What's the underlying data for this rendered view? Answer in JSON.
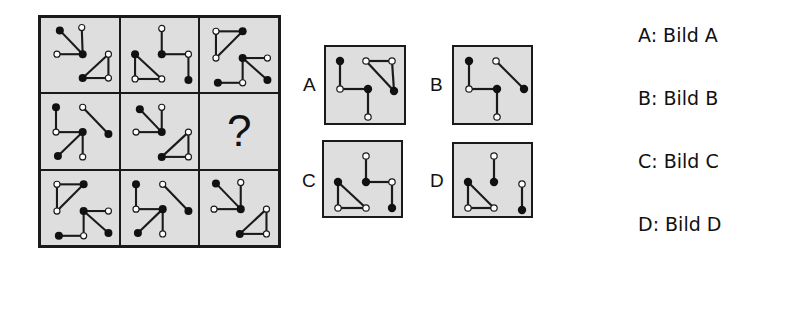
{
  "puzzle": {
    "question_mark": "?",
    "cells": [
      {
        "lines": [
          [
            19,
            13,
            43,
            38
          ],
          [
            42,
            10,
            43,
            38
          ],
          [
            16,
            38,
            43,
            38
          ],
          [
            43,
            63,
            70,
            38
          ],
          [
            70,
            38,
            70,
            63
          ],
          [
            70,
            63,
            43,
            63
          ]
        ],
        "filled": [
          [
            19,
            13
          ],
          [
            43,
            38
          ],
          [
            43,
            63
          ]
        ],
        "open": [
          [
            42,
            10
          ],
          [
            16,
            38
          ],
          [
            70,
            38
          ],
          [
            70,
            63
          ]
        ]
      },
      {
        "lines": [
          [
            42,
            11,
            42,
            38
          ],
          [
            42,
            38,
            70,
            38
          ],
          [
            70,
            38,
            70,
            65
          ],
          [
            14,
            38,
            42,
            64
          ],
          [
            14,
            38,
            14,
            64
          ],
          [
            14,
            64,
            42,
            64
          ]
        ],
        "filled": [
          [
            42,
            38
          ],
          [
            70,
            65
          ],
          [
            14,
            38
          ]
        ],
        "open": [
          [
            42,
            11
          ],
          [
            70,
            38
          ],
          [
            14,
            64
          ],
          [
            42,
            64
          ]
        ]
      },
      {
        "lines": [
          [
            16,
            14,
            44,
            14
          ],
          [
            16,
            14,
            16,
            42
          ],
          [
            16,
            42,
            44,
            14
          ],
          [
            44,
            42,
            70,
            42
          ],
          [
            44,
            42,
            70,
            65
          ],
          [
            44,
            42,
            44,
            68
          ],
          [
            18,
            68,
            44,
            68
          ]
        ],
        "filled": [
          [
            44,
            14
          ],
          [
            44,
            42
          ],
          [
            70,
            65
          ],
          [
            18,
            68
          ]
        ],
        "open": [
          [
            16,
            14
          ],
          [
            16,
            42
          ],
          [
            70,
            42
          ],
          [
            44,
            68
          ]
        ]
      },
      {
        "lines": [
          [
            15,
            14,
            15,
            40
          ],
          [
            15,
            40,
            43,
            40
          ],
          [
            43,
            40,
            17,
            65
          ],
          [
            43,
            40,
            43,
            66
          ],
          [
            43,
            14,
            70,
            42
          ]
        ],
        "filled": [
          [
            15,
            14
          ],
          [
            43,
            40
          ],
          [
            17,
            65
          ],
          [
            70,
            42
          ]
        ],
        "open": [
          [
            15,
            40
          ],
          [
            43,
            66
          ],
          [
            43,
            14
          ]
        ]
      },
      {
        "lines": [
          [
            19,
            16,
            42,
            40
          ],
          [
            42,
            14,
            42,
            40
          ],
          [
            15,
            40,
            42,
            40
          ],
          [
            42,
            66,
            70,
            40
          ],
          [
            70,
            40,
            70,
            66
          ],
          [
            70,
            66,
            42,
            66
          ]
        ],
        "filled": [
          [
            19,
            16
          ],
          [
            42,
            40
          ],
          [
            42,
            66
          ]
        ],
        "open": [
          [
            42,
            14
          ],
          [
            15,
            40
          ],
          [
            70,
            40
          ],
          [
            70,
            66
          ]
        ]
      },
      null,
      {
        "lines": [
          [
            16,
            14,
            44,
            14
          ],
          [
            16,
            14,
            16,
            42
          ],
          [
            16,
            42,
            44,
            14
          ],
          [
            44,
            42,
            70,
            42
          ],
          [
            44,
            42,
            70,
            65
          ],
          [
            44,
            42,
            44,
            68
          ],
          [
            18,
            68,
            44,
            68
          ]
        ],
        "filled": [
          [
            44,
            14
          ],
          [
            44,
            42
          ],
          [
            70,
            65
          ],
          [
            18,
            68
          ]
        ],
        "open": [
          [
            16,
            14
          ],
          [
            16,
            42
          ],
          [
            70,
            42
          ],
          [
            44,
            68
          ]
        ]
      },
      {
        "lines": [
          [
            15,
            14,
            15,
            40
          ],
          [
            15,
            40,
            43,
            40
          ],
          [
            43,
            40,
            17,
            65
          ],
          [
            43,
            40,
            43,
            66
          ],
          [
            43,
            14,
            70,
            42
          ]
        ],
        "filled": [
          [
            15,
            14
          ],
          [
            43,
            40
          ],
          [
            17,
            65
          ],
          [
            70,
            42
          ]
        ],
        "open": [
          [
            15,
            40
          ],
          [
            43,
            66
          ],
          [
            43,
            14
          ]
        ]
      },
      {
        "lines": [
          [
            16,
            13,
            42,
            40
          ],
          [
            42,
            12,
            42,
            40
          ],
          [
            14,
            40,
            42,
            40
          ],
          [
            41,
            66,
            69,
            40
          ],
          [
            69,
            40,
            69,
            66
          ],
          [
            69,
            66,
            41,
            66
          ]
        ],
        "filled": [
          [
            16,
            13
          ],
          [
            42,
            40
          ],
          [
            41,
            66
          ]
        ],
        "open": [
          [
            42,
            12
          ],
          [
            14,
            40
          ],
          [
            69,
            40
          ],
          [
            69,
            66
          ]
        ]
      }
    ]
  },
  "options": [
    {
      "letter": "A",
      "box": [
        324,
        45,
        82,
        80
      ],
      "label_pos": [
        303,
        74
      ],
      "lines": [
        [
          14,
          14,
          14,
          42
        ],
        [
          14,
          42,
          42,
          42
        ],
        [
          42,
          42,
          42,
          70
        ],
        [
          40,
          14,
          66,
          14
        ],
        [
          40,
          14,
          68,
          44
        ],
        [
          66,
          14,
          68,
          44
        ]
      ],
      "filled": [
        [
          14,
          14
        ],
        [
          42,
          42
        ],
        [
          68,
          44
        ]
      ],
      "open": [
        [
          14,
          42
        ],
        [
          42,
          70
        ],
        [
          40,
          14
        ],
        [
          66,
          14
        ]
      ]
    },
    {
      "letter": "B",
      "box": [
        452,
        45,
        81,
        80
      ],
      "label_pos": [
        430,
        74
      ],
      "lines": [
        [
          15,
          14,
          15,
          42
        ],
        [
          15,
          42,
          43,
          42
        ],
        [
          43,
          42,
          43,
          70
        ],
        [
          42,
          14,
          70,
          42
        ]
      ],
      "filled": [
        [
          15,
          14
        ],
        [
          43,
          42
        ],
        [
          70,
          42
        ]
      ],
      "open": [
        [
          15,
          42
        ],
        [
          43,
          70
        ],
        [
          42,
          14
        ]
      ]
    },
    {
      "letter": "C",
      "box": [
        322,
        140,
        81,
        78
      ],
      "label_pos": [
        302,
        170
      ],
      "lines": [
        [
          42,
          14,
          42,
          40
        ],
        [
          42,
          40,
          68,
          40
        ],
        [
          68,
          40,
          68,
          66
        ],
        [
          14,
          40,
          42,
          66
        ],
        [
          14,
          40,
          14,
          66
        ],
        [
          14,
          66,
          42,
          66
        ]
      ],
      "filled": [
        [
          42,
          40
        ],
        [
          68,
          66
        ],
        [
          14,
          40
        ]
      ],
      "open": [
        [
          42,
          14
        ],
        [
          68,
          40
        ],
        [
          14,
          66
        ],
        [
          42,
          66
        ]
      ]
    },
    {
      "letter": "D",
      "box": [
        452,
        142,
        81,
        76
      ],
      "label_pos": [
        430,
        170
      ],
      "lines": [
        [
          40,
          12,
          40,
          38
        ],
        [
          14,
          38,
          40,
          64
        ],
        [
          14,
          38,
          14,
          64
        ],
        [
          14,
          64,
          40,
          64
        ],
        [
          68,
          40,
          68,
          66
        ]
      ],
      "filled": [
        [
          40,
          38
        ],
        [
          14,
          38
        ],
        [
          68,
          66
        ]
      ],
      "open": [
        [
          40,
          12
        ],
        [
          14,
          64
        ],
        [
          40,
          64
        ],
        [
          68,
          40
        ]
      ]
    }
  ],
  "answers": [
    {
      "key": "A",
      "label": "A: Bild A"
    },
    {
      "key": "B",
      "label": "B: Bild B"
    },
    {
      "key": "C",
      "label": "C: Bild C"
    },
    {
      "key": "D",
      "label": "D: Bild D"
    }
  ]
}
